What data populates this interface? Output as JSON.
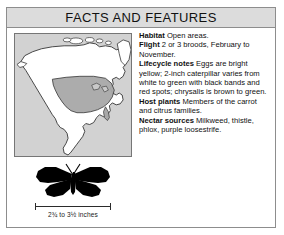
{
  "header": {
    "title": "FACTS AND FEATURES"
  },
  "map": {
    "name": "north-america-range-map",
    "region": "North America",
    "range_shading_color": "#a8a8a8",
    "land_color": "#ffffff",
    "ocean_color": "#d2d2d2",
    "outline_color": "#333333"
  },
  "facts": [
    {
      "label": "Habitat",
      "text": "Open areas."
    },
    {
      "label": "Flight",
      "text": "2 or 3 broods, February to November."
    },
    {
      "label": "Lifecycle notes",
      "text": "Eggs are bright yellow; 2-inch caterpillar varies from white to green with black bands and red spots; chrysalis is brown to green."
    },
    {
      "label": "Host plants",
      "text": "Members of the carrot and citrus families."
    },
    {
      "label": "Nectar sources",
      "text": "Milkweed, thistle, phlox, purple loosestrife."
    }
  ],
  "specimen": {
    "silhouette": "butterfly-silhouette",
    "silhouette_color": "#000000",
    "scale_caption": "2¾ to 3½ inches"
  }
}
